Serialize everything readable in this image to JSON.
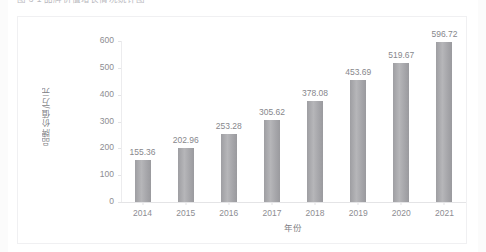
{
  "page": {
    "caption": "图 3-1  品牌价值增长情况统计图"
  },
  "chart_data": {
    "type": "bar",
    "title": "",
    "xlabel": "年份",
    "ylabel": "品牌价值/万元",
    "categories": [
      "2014",
      "2015",
      "2016",
      "2017",
      "2018",
      "2019",
      "2020",
      "2021"
    ],
    "values": [
      155.36,
      202.96,
      253.28,
      305.62,
      378.08,
      453.69,
      519.67,
      596.72
    ],
    "data_labels": [
      "155.36",
      "202.96",
      "253.28",
      "305.62",
      "378.08",
      "453.69",
      "519.67",
      "596.72"
    ],
    "ylim": [
      0,
      600
    ],
    "ytick_values": [
      0,
      100,
      200,
      300,
      400,
      500,
      600
    ],
    "ytick_labels": [
      "0",
      "100",
      "200",
      "300",
      "400",
      "500",
      "600"
    ],
    "grid": false,
    "legend": null,
    "series": [
      {
        "name": "品牌价值",
        "color": "#a8a8ac",
        "values": [
          155.36,
          202.96,
          253.28,
          305.62,
          378.08,
          453.69,
          519.67,
          596.72
        ]
      }
    ]
  },
  "colors": {
    "bar": "#a8a8ac",
    "axis": "#e4e4e6",
    "text": "#8d8d92",
    "frame": "#f0f0f2",
    "background": "#ffffff"
  }
}
